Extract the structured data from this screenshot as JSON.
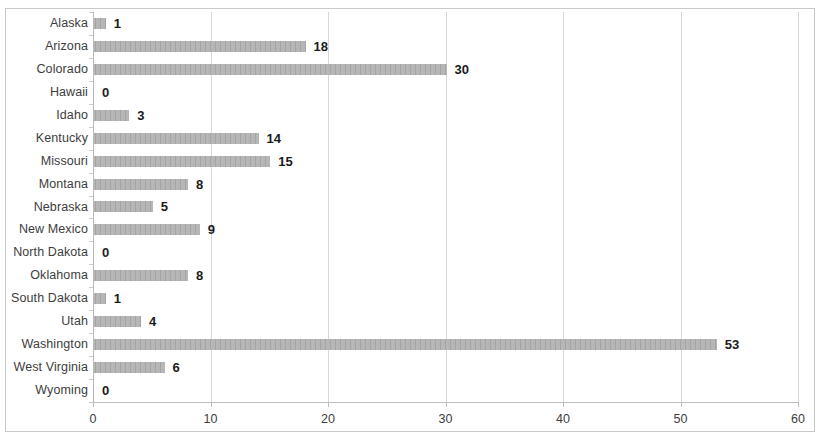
{
  "chart_data": {
    "type": "bar",
    "orientation": "horizontal",
    "title": "",
    "subtitle": "",
    "xlabel": "",
    "ylabel": "",
    "xlim": [
      0,
      60
    ],
    "xticks": [
      0,
      10,
      20,
      30,
      40,
      50,
      60
    ],
    "grid": "vertical",
    "legend": "none",
    "bar_color": "#a9a9a9",
    "show_data_labels": true,
    "categories": [
      "Alaska",
      "Arizona",
      "Colorado",
      "Hawaii",
      "Idaho",
      "Kentucky",
      "Missouri",
      "Montana",
      "Nebraska",
      "New Mexico",
      "North Dakota",
      "Oklahoma",
      "South Dakota",
      "Utah",
      "Washington",
      "West Virginia",
      "Wyoming"
    ],
    "values": [
      1,
      18,
      30,
      0,
      3,
      14,
      15,
      8,
      5,
      9,
      0,
      8,
      1,
      4,
      53,
      6,
      0
    ],
    "labels": [
      "1",
      "18",
      "30",
      "0",
      "3",
      "14",
      "15",
      "8",
      "5",
      "9",
      "0",
      "8",
      "1",
      "4",
      "53",
      "6",
      "0"
    ],
    "tick_labels": [
      "0",
      "10",
      "20",
      "30",
      "40",
      "50",
      "60"
    ]
  }
}
